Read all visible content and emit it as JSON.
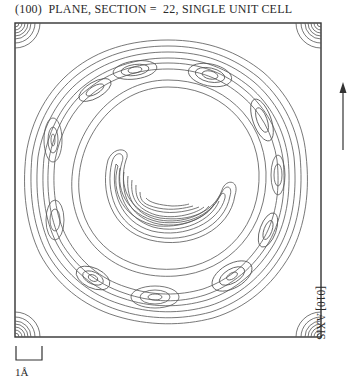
{
  "figure": {
    "title": "(100)  PLANE, SECTION =  22, SINGLE UNIT CELL",
    "axis_label": "[010] AXIS",
    "axis_arrow": "up-arrow",
    "scale_bar_label": "1Å",
    "plot_type": "contour map",
    "line_color": "#555555",
    "frame_color": "#333333"
  }
}
